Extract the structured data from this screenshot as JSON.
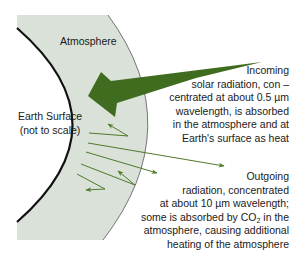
{
  "diagram": {
    "colors": {
      "atmosphere_fill": "#d9e1d8",
      "earth_fill": "#ffffff",
      "earth_outline": "#111111",
      "atmosphere_outline": "#555555",
      "arrow_green": "#3f6c1e",
      "thin_arrow_green": "#4f7a2c",
      "text": "#1a1a1a"
    },
    "labels": {
      "atmosphere": "Atmosphere",
      "earth_surface_line1": "Earth Surface",
      "earth_surface_line2": "(not to scale)"
    },
    "incoming": {
      "lines": [
        "Incoming",
        "solar radiation, con –",
        "centrated at about 0.5 µm",
        "wavelength, is absorbed",
        "in the atmosphere and at",
        "Earth's surface as heat"
      ]
    },
    "outgoing": {
      "lines": [
        "Outgoing",
        "radiation, concentrated",
        "at about 10 µm wavelength;",
        "some is absorbed by CO",
        "2",
        " in the",
        "atmosphere, causing additional",
        "heating of the atmosphere"
      ]
    },
    "arrows": [
      {
        "name": "incoming-solar-arrow",
        "type": "thick"
      },
      {
        "name": "outgoing-reflected-arrow-1",
        "type": "thin-zigzag"
      },
      {
        "name": "outgoing-escaping-arrow-1",
        "type": "thin-straight"
      },
      {
        "name": "outgoing-escaping-arrow-2",
        "type": "thin-straight"
      },
      {
        "name": "outgoing-reflected-arrow-2",
        "type": "thin-zigzag"
      },
      {
        "name": "outgoing-reflected-arrow-3",
        "type": "thin-zigzag"
      }
    ]
  }
}
